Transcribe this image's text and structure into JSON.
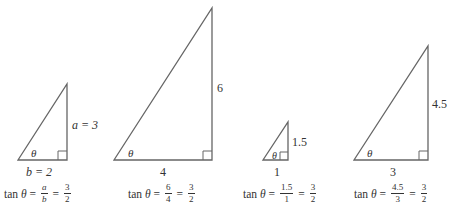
{
  "triangles": [
    {
      "id": "t1",
      "opposite_label": "a = 3",
      "adjacent_label": "b = 2",
      "angle_label": "θ",
      "formula": {
        "prefix": "tan",
        "theta": "θ",
        "eq": "=",
        "frac1_num": "a",
        "frac1_den": "b",
        "frac2_num": "3",
        "frac2_den": "2"
      }
    },
    {
      "id": "t2",
      "opposite_label": "6",
      "adjacent_label": "4",
      "angle_label": "θ",
      "formula": {
        "prefix": "tan",
        "theta": "θ",
        "eq": "=",
        "frac1_num": "6",
        "frac1_den": "4",
        "frac2_num": "3",
        "frac2_den": "2"
      }
    },
    {
      "id": "t3",
      "opposite_label": "1.5",
      "adjacent_label": "1",
      "angle_label": "θ",
      "formula": {
        "prefix": "tan",
        "theta": "θ",
        "eq": "=",
        "frac1_num": "1.5",
        "frac1_den": "1",
        "frac2_num": "3",
        "frac2_den": "2"
      }
    },
    {
      "id": "t4",
      "opposite_label": "4.5",
      "adjacent_label": "3",
      "angle_label": "θ",
      "formula": {
        "prefix": "tan",
        "theta": "θ",
        "eq": "=",
        "frac1_num": "4.5",
        "frac1_den": "3",
        "frac2_num": "3",
        "frac2_den": "2"
      }
    }
  ],
  "colors": {
    "stroke": "#555555",
    "text": "#333333"
  }
}
